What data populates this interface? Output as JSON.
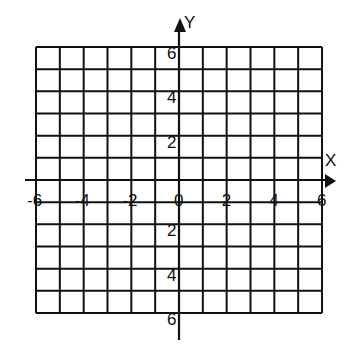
{
  "diagram": {
    "type": "coordinate-grid",
    "x_axis": {
      "label": "X",
      "range": [
        -6,
        6
      ],
      "tick_labels": [
        "-6",
        "-4",
        "-2",
        "0",
        "2",
        "4",
        "6"
      ]
    },
    "y_axis": {
      "label": "Y",
      "range": [
        -6,
        6
      ],
      "tick_labels_positive": [
        "6",
        "4",
        "2"
      ],
      "tick_labels_negative": [
        "2",
        "4",
        "6"
      ]
    },
    "grid": {
      "columns": 12,
      "rows": 12,
      "step": 1
    },
    "colors": {
      "line": "#111111",
      "background": "#ffffff"
    }
  }
}
